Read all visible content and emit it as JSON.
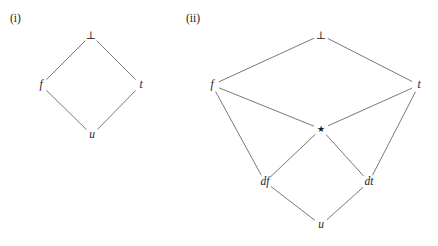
{
  "figure": {
    "background_color": "#ffffff",
    "edge_color": "#555555",
    "text_color": "#1c1c1c",
    "width": 438,
    "height": 246
  },
  "panels": [
    {
      "id": "panel-i",
      "label": "(i)",
      "label_x": 10,
      "label_y": 13,
      "nodes": [
        {
          "id": "bot",
          "label": "⊥",
          "x": 91,
          "y": 35,
          "style": "bot-sym"
        },
        {
          "id": "f",
          "label": "f",
          "x": 41,
          "y": 85,
          "style": "italic"
        },
        {
          "id": "t",
          "label": "t",
          "x": 141,
          "y": 85,
          "style": "italic"
        },
        {
          "id": "u",
          "label": "u",
          "x": 92,
          "y": 135,
          "style": "italic"
        }
      ],
      "edges": [
        {
          "from": "bot",
          "to": "f"
        },
        {
          "from": "bot",
          "to": "t"
        },
        {
          "from": "f",
          "to": "u"
        },
        {
          "from": "t",
          "to": "u"
        }
      ]
    },
    {
      "id": "panel-ii",
      "label": "(ii)",
      "label_x": 186,
      "label_y": 13,
      "nodes": [
        {
          "id": "bot",
          "label": "⊥",
          "x": 321,
          "y": 35,
          "style": "bot-sym"
        },
        {
          "id": "f",
          "label": "f",
          "x": 212,
          "y": 85,
          "style": "italic"
        },
        {
          "id": "t",
          "label": "t",
          "x": 419,
          "y": 85,
          "style": "italic"
        },
        {
          "id": "star",
          "label": "★",
          "x": 321,
          "y": 129,
          "style": "star-sym"
        },
        {
          "id": "df",
          "label": "df",
          "x": 265,
          "y": 182,
          "style": "italic"
        },
        {
          "id": "dt",
          "label": "dt",
          "x": 369,
          "y": 182,
          "style": "italic"
        },
        {
          "id": "u",
          "label": "u",
          "x": 321,
          "y": 225,
          "style": "italic"
        }
      ],
      "edges": [
        {
          "from": "bot",
          "to": "f"
        },
        {
          "from": "bot",
          "to": "t"
        },
        {
          "from": "f",
          "to": "star"
        },
        {
          "from": "t",
          "to": "star"
        },
        {
          "from": "f",
          "to": "df"
        },
        {
          "from": "t",
          "to": "dt"
        },
        {
          "from": "star",
          "to": "df"
        },
        {
          "from": "star",
          "to": "dt"
        },
        {
          "from": "df",
          "to": "u"
        },
        {
          "from": "dt",
          "to": "u"
        }
      ]
    }
  ]
}
